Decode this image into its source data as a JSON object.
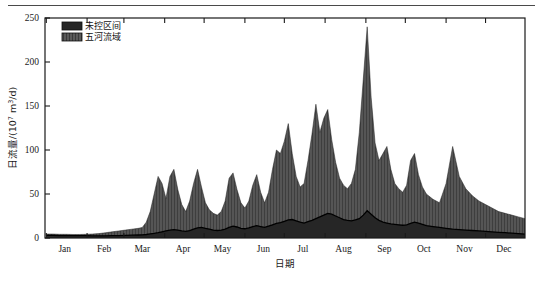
{
  "figure": {
    "background_color": "#ffffff",
    "frame_color": "#1a1a1a",
    "rule_color": "#4a4a4a"
  },
  "legend": {
    "position": "top-left-inside",
    "entries": [
      {
        "label": "未控区间",
        "color": "#262626",
        "pattern": "solid-dark",
        "swatch_name": "legend-swatch-uncontrolled"
      },
      {
        "label": "五河流域",
        "color": "#4f4f4f",
        "pattern": "dense-hatch",
        "swatch_name": "legend-swatch-five-rivers"
      }
    ]
  },
  "chart_data": {
    "type": "area",
    "stacked": true,
    "title": "",
    "subtitle": "",
    "xlabel": "日期",
    "ylabel": "日流量/(10⁷ m³/d)",
    "ylabel_parts": {
      "prefix": "日流量/(10",
      "exponent": "7",
      "suffix": " m",
      "exponent2": "3",
      "tail": "/d)"
    },
    "xlim": [
      0,
      365
    ],
    "ylim": [
      0,
      250
    ],
    "yticks": [
      0,
      50,
      100,
      150,
      200,
      250
    ],
    "ytick_labels": [
      "0",
      "50",
      "100",
      "150",
      "200",
      "250"
    ],
    "xtick_labels": [
      "Jan",
      "Feb",
      "Mar",
      "Apr",
      "May",
      "Jun",
      "Jul",
      "Aug",
      "Sep",
      "Oct",
      "Nov",
      "Dec"
    ],
    "xtick_positions_day": [
      15,
      45,
      74,
      105,
      135,
      166,
      196,
      227,
      258,
      288,
      319,
      349
    ],
    "grid": false,
    "units": "10^7 m^3/d",
    "series": [
      {
        "name": "未控区间",
        "color": "#262626",
        "pattern": "solid",
        "note": "lower band of stack, bounded above by solid black line",
        "x": [
          1,
          6,
          11,
          16,
          21,
          26,
          31,
          36,
          41,
          46,
          51,
          56,
          61,
          66,
          71,
          74,
          77,
          80,
          83,
          86,
          89,
          92,
          95,
          98,
          101,
          104,
          107,
          110,
          113,
          116,
          119,
          122,
          125,
          128,
          131,
          134,
          137,
          140,
          143,
          146,
          149,
          152,
          155,
          158,
          161,
          164,
          167,
          170,
          173,
          176,
          179,
          182,
          185,
          188,
          191,
          194,
          197,
          200,
          203,
          206,
          209,
          212,
          215,
          218,
          221,
          224,
          227,
          230,
          233,
          236,
          239,
          242,
          245,
          248,
          251,
          254,
          257,
          260,
          263,
          266,
          269,
          272,
          275,
          278,
          281,
          284,
          287,
          290,
          295,
          300,
          305,
          310,
          315,
          320,
          325,
          330,
          335,
          340,
          345,
          350,
          355,
          360,
          365
        ],
        "y": [
          3.0,
          3.0,
          2.8,
          2.8,
          2.6,
          2.6,
          2.6,
          2.5,
          2.5,
          2.5,
          2.6,
          2.8,
          3.0,
          3.2,
          3.4,
          3.6,
          4.0,
          4.6,
          5.2,
          6.0,
          7.0,
          8.0,
          9.0,
          9.5,
          9.0,
          8.0,
          7.5,
          8.5,
          10.0,
          11.5,
          12.0,
          11.0,
          10.0,
          9.0,
          8.5,
          9.0,
          10.0,
          12.0,
          13.5,
          12.5,
          11.0,
          10.5,
          11.5,
          13.0,
          14.0,
          13.0,
          12.0,
          13.5,
          15.0,
          16.5,
          17.5,
          19.0,
          20.5,
          21.0,
          19.5,
          18.0,
          17.0,
          18.5,
          20.0,
          22.0,
          24.0,
          26.0,
          28.0,
          27.0,
          25.0,
          23.0,
          21.0,
          20.0,
          19.5,
          20.5,
          22.0,
          26.0,
          31.0,
          27.0,
          23.0,
          20.0,
          18.0,
          17.0,
          16.0,
          15.5,
          15.0,
          14.5,
          15.0,
          16.5,
          18.0,
          17.0,
          15.5,
          14.0,
          13.0,
          12.0,
          11.0,
          10.0,
          9.5,
          9.0,
          8.5,
          8.0,
          7.5,
          7.0,
          6.5,
          6.0,
          5.5,
          5.0,
          4.5
        ]
      },
      {
        "name": "五河流域",
        "color": "#4f4f4f",
        "pattern": "dense-hatch",
        "note": "upper band of stack; total stack height equals basin + uncontrolled",
        "x": [
          1,
          6,
          11,
          16,
          21,
          26,
          31,
          36,
          41,
          46,
          51,
          56,
          61,
          66,
          71,
          74,
          77,
          80,
          83,
          86,
          89,
          92,
          95,
          98,
          101,
          104,
          107,
          110,
          113,
          116,
          119,
          122,
          125,
          128,
          131,
          134,
          137,
          140,
          143,
          146,
          149,
          152,
          155,
          158,
          161,
          164,
          167,
          170,
          173,
          176,
          179,
          182,
          185,
          188,
          191,
          194,
          197,
          200,
          203,
          206,
          209,
          212,
          215,
          218,
          221,
          224,
          227,
          230,
          233,
          236,
          239,
          242,
          245,
          248,
          251,
          254,
          257,
          260,
          263,
          266,
          269,
          272,
          275,
          278,
          281,
          284,
          287,
          290,
          295,
          300,
          305,
          310,
          315,
          320,
          325,
          330,
          335,
          340,
          345,
          350,
          355,
          360,
          365
        ],
        "y_total": [
          4.5,
          4.5,
          4.2,
          4.2,
          4.0,
          4.0,
          4.2,
          4.5,
          5.0,
          6.0,
          7.0,
          8.0,
          9.0,
          10.0,
          11.0,
          12.0,
          18.0,
          30.0,
          50.0,
          70.0,
          62.0,
          45.0,
          70.0,
          78.0,
          55.0,
          38.0,
          30.0,
          42.0,
          62.0,
          78.0,
          58.0,
          40.0,
          32.0,
          28.0,
          26.0,
          30.0,
          42.0,
          68.0,
          74.0,
          55.0,
          40.0,
          34.0,
          42.0,
          60.0,
          72.0,
          52.0,
          40.0,
          52.0,
          78.0,
          100.0,
          96.0,
          110.0,
          130.0,
          96.0,
          70.0,
          58.0,
          62.0,
          88.0,
          118.0,
          152.0,
          120.0,
          136.0,
          146.0,
          112.0,
          86.0,
          68.0,
          60.0,
          56.0,
          62.0,
          78.0,
          120.0,
          180.0,
          240.0,
          160.0,
          108.0,
          88.0,
          96.0,
          104.0,
          78.0,
          62.0,
          56.0,
          52.0,
          60.0,
          88.0,
          96.0,
          72.0,
          58.0,
          50.0,
          44.0,
          40.0,
          62.0,
          104.0,
          70.0,
          56.0,
          48.0,
          42.0,
          38.0,
          34.0,
          30.0,
          28.0,
          26.0,
          24.0,
          22.0
        ],
        "peak_value": 240,
        "peak_period": "late June / early July"
      }
    ],
    "annotations": [],
    "peak_total": 240,
    "legend_position": "upper-left"
  }
}
